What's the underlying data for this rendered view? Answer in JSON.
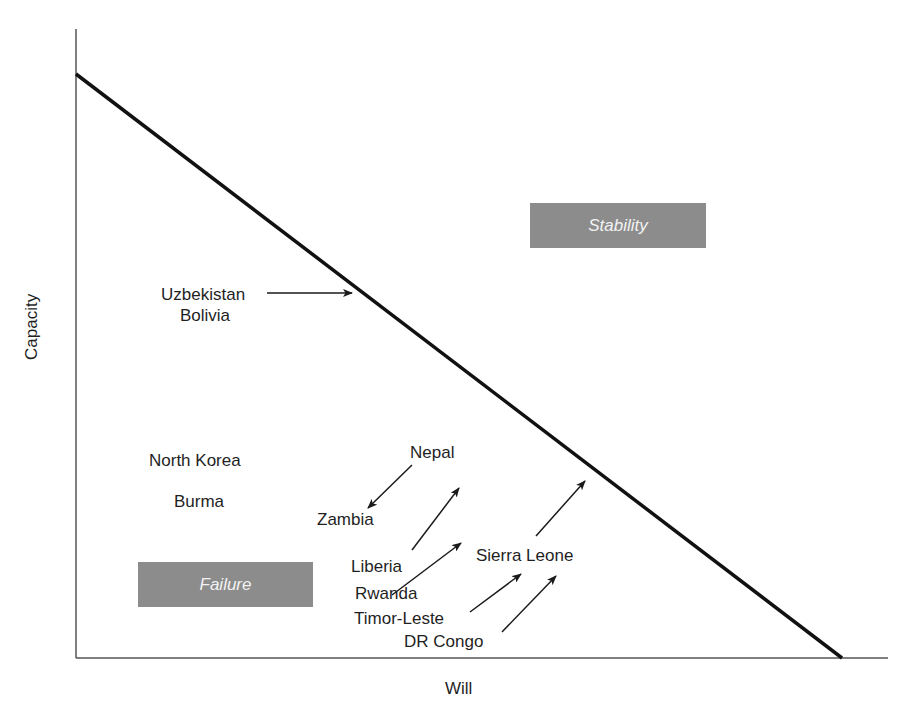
{
  "diagram": {
    "type": "capacity-will quadrant diagram",
    "axes": {
      "x_label": "Will",
      "y_label": "Capacity"
    },
    "threshold_line": {
      "from": "high capacity / zero will",
      "to": "zero capacity / high will"
    },
    "regions": [
      {
        "id": "stability",
        "label": "Stability",
        "position": "above-right of line"
      },
      {
        "id": "failure",
        "label": "Failure",
        "position": "below-left of line"
      }
    ],
    "countries": [
      {
        "id": "uzbekistan",
        "label": "Uzbekistan",
        "arrow": "points right toward line"
      },
      {
        "id": "bolivia",
        "label": "Bolivia",
        "arrow": "none"
      },
      {
        "id": "north-korea",
        "label": "North Korea",
        "arrow": "none"
      },
      {
        "id": "burma",
        "label": "Burma",
        "arrow": "none"
      },
      {
        "id": "nepal",
        "label": "Nepal",
        "arrow": "points down-left toward Zambia"
      },
      {
        "id": "zambia",
        "label": "Zambia",
        "arrow": "none"
      },
      {
        "id": "liberia",
        "label": "Liberia",
        "arrow": "points up-right"
      },
      {
        "id": "rwanda",
        "label": "Rwanda",
        "arrow": "points up-right"
      },
      {
        "id": "sierra-leone",
        "label": "Sierra Leone",
        "arrow": "points up-right toward line"
      },
      {
        "id": "timor-leste",
        "label": "Timor-Leste",
        "arrow": "points up-right"
      },
      {
        "id": "dr-congo",
        "label": "DR Congo",
        "arrow": "points up-right"
      }
    ]
  },
  "colors": {
    "line": "#111111",
    "axis": "#555555",
    "box_fill": "#8c8c8c",
    "box_text": "#f2f2f2",
    "text": "#1f1f1f"
  }
}
